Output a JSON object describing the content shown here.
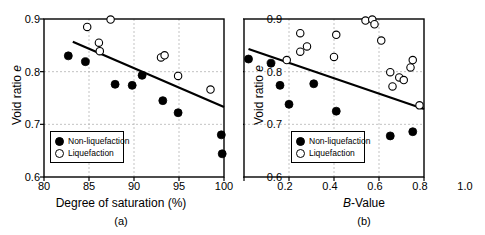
{
  "figure": {
    "background": "#ffffff",
    "foreground": "#000000",
    "grid_color": "#b4b4b4"
  },
  "panels": [
    {
      "caption": "(a)",
      "xlabel_plain": "Degree of saturation (%)",
      "ylabel_plain": "Void ratio e"
    },
    {
      "caption": "(b)",
      "xlabel_plain": "B-Value",
      "ylabel_plain": "Void ratio e"
    }
  ],
  "legend": {
    "non_liquefaction": "Non-liquefaction",
    "liquefaction": "Liquefaction"
  },
  "chart_data": [
    {
      "type": "scatter",
      "panel": "(a)",
      "title": "",
      "xlabel": "Degree of saturation (%)",
      "ylabel": "Void ratio e",
      "xlim": [
        80,
        100
      ],
      "ylim": [
        0.6,
        0.9
      ],
      "xticks": [
        80,
        85,
        90,
        95,
        100
      ],
      "yticks": [
        0.6,
        0.7,
        0.8,
        0.9
      ],
      "xtick_labels": [
        "80",
        "85",
        "90",
        "95",
        "100"
      ],
      "ytick_labels": [
        "0.6",
        "0.7",
        "0.8",
        "0.9"
      ],
      "grid": true,
      "grid_style": "dashed",
      "legend_position": "lower-left",
      "series": [
        {
          "name": "Non-liquefaction",
          "marker": "filled-circle",
          "color": "#000000",
          "points": [
            [
              82.7,
              0.83
            ],
            [
              84.6,
              0.819
            ],
            [
              87.9,
              0.776
            ],
            [
              89.8,
              0.774
            ],
            [
              90.9,
              0.793
            ],
            [
              93.2,
              0.745
            ],
            [
              94.9,
              0.722
            ],
            [
              99.7,
              0.68
            ],
            [
              99.8,
              0.644
            ]
          ]
        },
        {
          "name": "Liquefaction",
          "marker": "open-circle",
          "color": "#000000",
          "points": [
            [
              84.8,
              0.885
            ],
            [
              87.4,
              0.899
            ],
            [
              86.1,
              0.855
            ],
            [
              86.2,
              0.839
            ],
            [
              93.0,
              0.827
            ],
            [
              93.4,
              0.831
            ],
            [
              94.9,
              0.792
            ],
            [
              98.5,
              0.766
            ]
          ]
        }
      ],
      "trend_line": {
        "x": [
          83.2,
          100.0
        ],
        "y": [
          0.857,
          0.733
        ],
        "style": "solid",
        "color": "#000000"
      }
    },
    {
      "type": "scatter",
      "panel": "(b)",
      "title": "",
      "xlabel": "B-Value",
      "ylabel": "Void ratio e",
      "xlim": [
        0.2,
        1.0
      ],
      "ylim": [
        0.6,
        0.9
      ],
      "xticks": [
        0.2,
        0.4,
        0.6,
        0.8,
        1.0
      ],
      "yticks": [
        0.6,
        0.7,
        0.8,
        0.9
      ],
      "xtick_labels": [
        "0.2",
        "0.4",
        "0.6",
        "0.8",
        "1.0"
      ],
      "ytick_labels": [
        "0.6",
        "0.7",
        "0.8",
        "0.9"
      ],
      "grid": true,
      "grid_style": "dashed",
      "legend_position": "lower-left",
      "series": [
        {
          "name": "Non-liquefaction",
          "marker": "filled-circle",
          "color": "#000000",
          "points": [
            [
              0.22,
              0.824
            ],
            [
              0.32,
              0.816
            ],
            [
              0.36,
              0.774
            ],
            [
              0.4,
              0.738
            ],
            [
              0.51,
              0.777
            ],
            [
              0.61,
              0.725
            ],
            [
              0.61,
              0.646
            ],
            [
              0.85,
              0.678
            ],
            [
              0.95,
              0.686
            ]
          ]
        },
        {
          "name": "Liquefaction",
          "marker": "open-circle",
          "color": "#000000",
          "points": [
            [
              0.39,
              0.822
            ],
            [
              0.45,
              0.873
            ],
            [
              0.45,
              0.838
            ],
            [
              0.48,
              0.848
            ],
            [
              0.6,
              0.828
            ],
            [
              0.61,
              0.87
            ],
            [
              0.74,
              0.897
            ],
            [
              0.77,
              0.899
            ],
            [
              0.78,
              0.89
            ],
            [
              0.81,
              0.859
            ],
            [
              0.85,
              0.799
            ],
            [
              0.86,
              0.772
            ],
            [
              0.89,
              0.789
            ],
            [
              0.91,
              0.784
            ],
            [
              0.94,
              0.808
            ],
            [
              0.95,
              0.822
            ],
            [
              0.98,
              0.736
            ]
          ]
        }
      ],
      "trend_line": {
        "x": [
          0.22,
          1.0
        ],
        "y": [
          0.843,
          0.729
        ],
        "style": "solid",
        "color": "#000000"
      }
    }
  ]
}
